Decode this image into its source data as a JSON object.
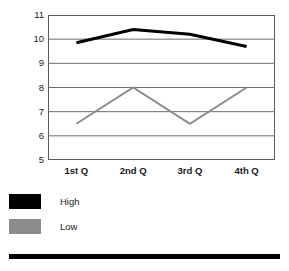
{
  "chart_data": {
    "type": "line",
    "title": "",
    "subtitle": "",
    "xlabel": "",
    "ylabel": "",
    "categories": [
      "1st Q",
      "2nd Q",
      "3rd Q",
      "4th Q"
    ],
    "series": [
      {
        "name": "High",
        "values": [
          9.85,
          10.4,
          10.2,
          9.7
        ],
        "color": "#000000",
        "line_width": 3
      },
      {
        "name": "Low",
        "values": [
          6.5,
          8.0,
          6.5,
          8.0
        ],
        "color": "#8c8c8c",
        "line_width": 2
      }
    ],
    "ylim": [
      5,
      11
    ],
    "ytick_labels": [
      "11",
      "10",
      "9",
      "8",
      "7",
      "6",
      "5"
    ],
    "ytick_values": [
      11,
      10,
      9,
      8,
      7,
      6,
      5
    ],
    "grid": true,
    "grid_axis": "y",
    "legend_position": "bottom-left",
    "legend_entries": [
      {
        "label": "High",
        "color": "#000000"
      },
      {
        "label": "Low",
        "color": "#8c8c8c"
      }
    ],
    "plot_border_color": "#5a5a5a",
    "plot_background": "#ffffff"
  },
  "decor": {
    "bottom_rule_color": "#000000"
  }
}
